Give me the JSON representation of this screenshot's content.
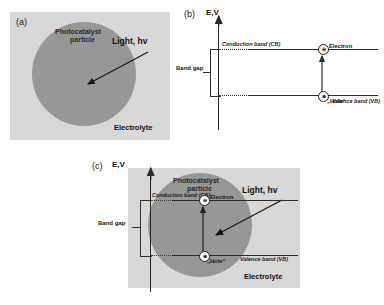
{
  "figure": {
    "background": "#ffffff",
    "gray_box_color": "#d8d8d8",
    "particle_color": "#979797"
  },
  "panel_a": {
    "tag": "(a)",
    "particle_label_line1": "Photocatalyst",
    "particle_label_line2": "particle",
    "light_label": "Light, hv",
    "electrolyte_label": "Electrolyte",
    "arrow_name": "light-arrow"
  },
  "panel_b": {
    "tag": "(b)",
    "axis_label": "E,V",
    "conduction_band_label": "Conduction band (CB)",
    "valence_band_label": "Valence band (VB)",
    "band_gap_label": "Band gap",
    "electron_label": "Electron",
    "electron_symbol": "⊖",
    "hole_label": "„Hole“",
    "hole_symbol": "⊕"
  },
  "panel_c": {
    "tag": "(c)",
    "axis_label": "E,V",
    "conduction_band_label": "Conduction band (CB)",
    "valence_band_label": "Valence band (VB)",
    "band_gap_label": "Band gap",
    "electron_label": "Electron",
    "electron_symbol": "⊖",
    "hole_label": "„Hole“",
    "hole_symbol": "⊕",
    "particle_label_line1": "Photocatalyst",
    "particle_label_line2": "particle",
    "light_label": "Light, hv",
    "electrolyte_label": "Electrolyte"
  }
}
